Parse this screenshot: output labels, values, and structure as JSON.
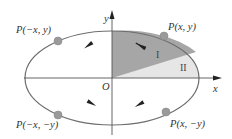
{
  "diagram": {
    "type": "ellipse-symmetry",
    "axes": {
      "x_label": "x",
      "y_label": "y",
      "origin_label": "O"
    },
    "points": [
      {
        "id": "q1",
        "label": "P(x, y)"
      },
      {
        "id": "q2",
        "label": "P(−x, y)"
      },
      {
        "id": "q3",
        "label": "P(−x, −y)"
      },
      {
        "id": "q4",
        "label": "P(x, −y)"
      }
    ],
    "regions": [
      {
        "id": "region-1",
        "label": "I",
        "color": "#a6a6a6"
      },
      {
        "id": "region-2",
        "label": "II",
        "color": "#e6e6e6"
      }
    ],
    "colors": {
      "ellipse_stroke": "#6e6e6e",
      "axis": "#555555",
      "point_fill": "#9a9a9a",
      "arrow": "#222222"
    }
  }
}
